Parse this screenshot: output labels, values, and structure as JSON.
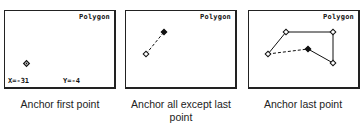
{
  "panels": [
    {
      "title": "Polygon",
      "caption": "Anchor first point",
      "coords": {
        "x_label": "X=-31",
        "y_label": "Y=-4"
      }
    },
    {
      "title": "Polygon",
      "caption": "Anchor all except last point"
    },
    {
      "title": "Polygon",
      "caption": "Anchor last point"
    }
  ]
}
